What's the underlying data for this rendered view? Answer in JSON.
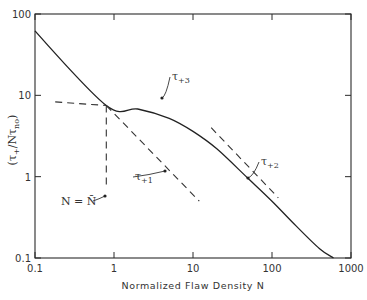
{
  "chart_data": {
    "type": "line",
    "title": "",
    "xlabel": "Normalized Flaw Density N",
    "ylabel": "(τ+/Nτno)",
    "xscale": "log",
    "yscale": "log",
    "xlim": [
      0.1,
      1000
    ],
    "ylim": [
      0.1,
      100
    ],
    "grid": false,
    "x_ticks": [
      "0.1",
      "1",
      "10",
      "100",
      "1000"
    ],
    "y_ticks": [
      "0.1",
      "1",
      "10",
      "100"
    ],
    "series": [
      {
        "name": "τ+3",
        "style": "solid",
        "points": [
          [
            0.1,
            62
          ],
          [
            0.8,
            7.5
          ],
          [
            2,
            6.8
          ],
          [
            5,
            5.2
          ],
          [
            10,
            3.6
          ],
          [
            20,
            2.2
          ],
          [
            50,
            0.95
          ],
          [
            100,
            0.5
          ],
          [
            200,
            0.25
          ],
          [
            400,
            0.13
          ],
          [
            600,
            0.1
          ]
        ]
      },
      {
        "name": "τ+1",
        "style": "dashed",
        "points": [
          [
            0.8,
            7.5
          ],
          [
            12,
            0.5
          ]
        ]
      },
      {
        "name": "horizontal-asymptote",
        "style": "dashed",
        "points": [
          [
            0.18,
            8.3
          ],
          [
            0.8,
            7.5
          ]
        ]
      },
      {
        "name": "τ+2",
        "style": "dashed",
        "points": [
          [
            17,
            4.0
          ],
          [
            120,
            0.55
          ]
        ]
      },
      {
        "name": "N = N̄",
        "style": "dashed-vertical",
        "points": [
          [
            0.8,
            7.5
          ],
          [
            0.8,
            0.7
          ]
        ]
      }
    ],
    "annotations": [
      {
        "text": "τ+3",
        "main": "τ",
        "sub": "+3",
        "x": 172,
        "y": 80,
        "target": [
          162,
          98
        ]
      },
      {
        "text": "τ+2",
        "main": "τ",
        "sub": "+2",
        "x": 261,
        "y": 165,
        "target": [
          248,
          178
        ]
      },
      {
        "text": "τ+1",
        "main": "τ",
        "sub": "+1",
        "x": 135,
        "y": 180,
        "target": [
          165,
          171
        ]
      },
      {
        "text": "N = N̄",
        "x": 61,
        "y": 205,
        "target": [
          105,
          196
        ]
      }
    ]
  },
  "ui": {
    "x_axis_title": "Normalized Flaw Density N",
    "y_axis_title": "(τ+/Nτno)"
  }
}
